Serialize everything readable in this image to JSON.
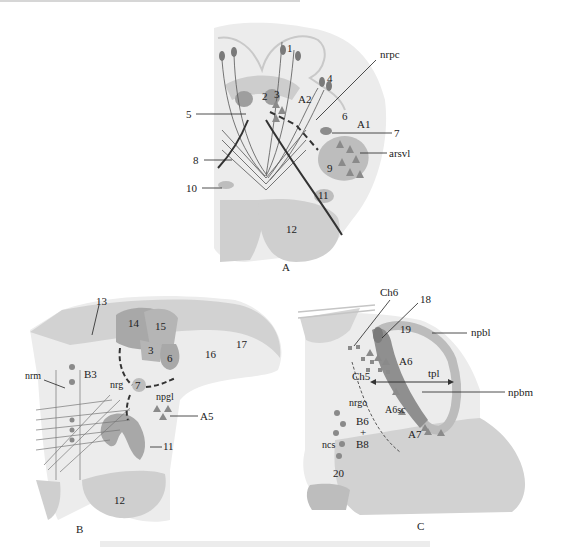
{
  "figure": {
    "panels": [
      {
        "id": "A",
        "label": "A",
        "numbers": [
          "1",
          "2",
          "3",
          "4",
          "5",
          "6",
          "7",
          "8",
          "9",
          "10",
          "11",
          "12"
        ],
        "abbreviations": [
          "nrpc",
          "A2",
          "A1",
          "arsvl"
        ]
      },
      {
        "id": "B",
        "label": "B",
        "numbers": [
          "13",
          "14",
          "15",
          "3",
          "6",
          "16",
          "17",
          "7",
          "11",
          "12"
        ],
        "abbreviations": [
          "nrm",
          "B3",
          "nrg",
          "npgl",
          "A5"
        ]
      },
      {
        "id": "C",
        "label": "C",
        "numbers": [
          "18",
          "19",
          "20"
        ],
        "abbreviations": [
          "Ch6",
          "npbl",
          "A6",
          "Ch5",
          "tpl",
          "npbm",
          "nrgo",
          "A6sc",
          "B6",
          "+",
          "B8",
          "ncs",
          "A7"
        ]
      }
    ],
    "legend_symbols": {
      "triangle": "noradrenergic cell group marker",
      "circle": "serotonergic cell group marker",
      "square": "cholinergic cell group marker"
    },
    "colors": {
      "tissue_light": "#e6e6e6",
      "tissue_mid": "#cfcfcf",
      "nucleus_dark": "#9a9a9a",
      "marker": "#7d7d7d",
      "line": "#333333"
    }
  }
}
